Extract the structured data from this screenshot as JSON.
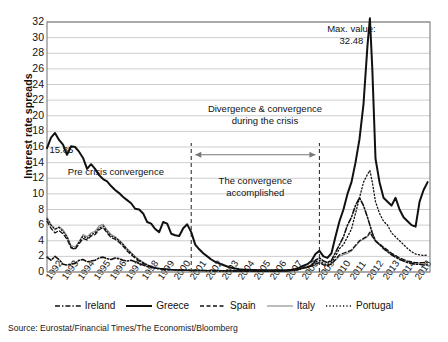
{
  "axis": {
    "ylabel": "Interest rate spreads",
    "yticks": [
      0,
      2,
      4,
      6,
      8,
      10,
      12,
      14,
      16,
      18,
      20,
      22,
      24,
      26,
      28,
      30,
      32
    ],
    "ylim": [
      0,
      32
    ],
    "xticks": [
      "1992",
      "1993",
      "1994",
      "1995",
      "1996",
      "1997",
      "1998",
      "1999",
      "2000",
      "2001",
      "2002",
      "2003",
      "2004",
      "2005",
      "2006",
      "2007",
      "2008",
      "2009",
      "2010",
      "2011",
      "2012",
      "2013",
      "2014",
      "2015"
    ],
    "xlim": [
      1992,
      2015
    ]
  },
  "annotations": {
    "start_value": "15.85",
    "max_value": "Max. value:\n32.48",
    "pre_crisis": "Pre crisis convergence",
    "divergence": "Divergence & convergence\nduring the crisis",
    "convergence": "The convergence\naccomplished"
  },
  "legend": [
    {
      "label": "Ireland",
      "style": "dash-dot",
      "color": "#111111",
      "width": 1.6
    },
    {
      "label": "Greece",
      "style": "solid",
      "color": "#111111",
      "width": 2.0
    },
    {
      "label": "Spain",
      "style": "dashed",
      "color": "#111111",
      "width": 1.3
    },
    {
      "label": "Italy",
      "style": "solid",
      "color": "#8f8f8f",
      "width": 1.2
    },
    {
      "label": "Portugal",
      "style": "dotted",
      "color": "#111111",
      "width": 1.3
    }
  ],
  "source": "Source: Eurostat/Financial Times/The Economist/Bloomberg",
  "colors": {
    "plot_border": "#6f6f6f",
    "gridline": "#b8b8b8",
    "marker_line": "#333333",
    "arrow": "#777777",
    "background": "#ffffff"
  },
  "chart_data": {
    "type": "line",
    "title": "",
    "xlabel": "",
    "ylabel": "Interest rate spreads",
    "xlim": [
      1992,
      2015.9
    ],
    "ylim": [
      0,
      32
    ],
    "grid": true,
    "legend_position": "bottom",
    "x": [
      1992.0,
      1992.25,
      1992.5,
      1992.75,
      1993.0,
      1993.25,
      1993.5,
      1993.75,
      1994.0,
      1994.25,
      1994.5,
      1994.75,
      1995.0,
      1995.25,
      1995.5,
      1995.75,
      1996.0,
      1996.25,
      1996.5,
      1996.75,
      1997.0,
      1997.25,
      1997.5,
      1997.75,
      1998.0,
      1998.25,
      1998.5,
      1998.75,
      1999.0,
      1999.25,
      1999.5,
      1999.75,
      2000.0,
      2000.25,
      2000.5,
      2000.75,
      2001.0,
      2001.25,
      2001.5,
      2001.75,
      2002.0,
      2002.25,
      2002.5,
      2002.75,
      2003.0,
      2003.25,
      2003.5,
      2003.75,
      2004.0,
      2004.25,
      2004.5,
      2004.75,
      2005.0,
      2005.25,
      2005.5,
      2005.75,
      2006.0,
      2006.25,
      2006.5,
      2006.75,
      2007.0,
      2007.25,
      2007.5,
      2007.75,
      2008.0,
      2008.25,
      2008.5,
      2008.75,
      2009.0,
      2009.25,
      2009.5,
      2009.75,
      2010.0,
      2010.25,
      2010.5,
      2010.75,
      2011.0,
      2011.25,
      2011.5,
      2011.75,
      2012.0,
      2012.15,
      2012.3,
      2012.5,
      2012.75,
      2013.0,
      2013.25,
      2013.5,
      2013.75,
      2014.0,
      2014.25,
      2014.5,
      2014.75,
      2015.0,
      2015.25,
      2015.5,
      2015.75
    ],
    "series": [
      {
        "name": "Greece",
        "style": "solid",
        "color": "#111111",
        "values": [
          15.85,
          17.2,
          17.8,
          16.9,
          16.3,
          15.0,
          16.1,
          16.0,
          15.4,
          14.6,
          13.2,
          13.8,
          13.2,
          12.4,
          11.9,
          11.6,
          11.0,
          10.5,
          10.1,
          9.6,
          9.2,
          8.8,
          8.1,
          8.0,
          7.5,
          6.4,
          6.2,
          5.5,
          5.1,
          6.4,
          6.2,
          4.9,
          4.7,
          4.6,
          5.6,
          6.1,
          5.1,
          3.5,
          2.9,
          2.4,
          2.0,
          1.6,
          1.3,
          1.1,
          0.9,
          0.7,
          0.55,
          0.45,
          0.35,
          0.3,
          0.28,
          0.26,
          0.25,
          0.24,
          0.24,
          0.23,
          0.22,
          0.22,
          0.22,
          0.23,
          0.25,
          0.28,
          0.4,
          0.55,
          0.8,
          1.0,
          1.4,
          2.3,
          2.7,
          2.0,
          1.8,
          2.4,
          4.5,
          6.5,
          8.0,
          10.0,
          11.5,
          14.0,
          17.0,
          21.5,
          29.0,
          32.48,
          26.0,
          14.5,
          11.5,
          9.5,
          9.0,
          8.5,
          9.5,
          8.0,
          7.0,
          6.5,
          6.0,
          5.8,
          9.0,
          10.5,
          11.5
        ]
      },
      {
        "name": "Portugal",
        "style": "dotted",
        "color": "#111111",
        "values": [
          6.8,
          6.0,
          5.5,
          5.7,
          5.2,
          4.5,
          3.2,
          3.0,
          3.8,
          4.6,
          4.3,
          4.8,
          5.0,
          5.6,
          5.9,
          5.2,
          4.6,
          4.4,
          4.0,
          3.5,
          2.9,
          2.4,
          1.9,
          1.5,
          1.2,
          0.9,
          0.7,
          0.55,
          0.45,
          0.4,
          0.35,
          0.3,
          0.28,
          0.26,
          0.25,
          0.24,
          0.22,
          0.2,
          0.2,
          0.2,
          0.18,
          0.18,
          0.17,
          0.17,
          0.16,
          0.16,
          0.15,
          0.15,
          0.14,
          0.14,
          0.14,
          0.14,
          0.13,
          0.13,
          0.13,
          0.13,
          0.13,
          0.13,
          0.14,
          0.15,
          0.17,
          0.2,
          0.28,
          0.4,
          0.6,
          0.7,
          0.9,
          1.3,
          1.5,
          1.1,
          0.9,
          1.2,
          2.0,
          3.0,
          3.5,
          4.5,
          5.5,
          7.5,
          9.5,
          11.5,
          12.5,
          13.0,
          11.5,
          9.0,
          7.5,
          6.5,
          6.0,
          5.0,
          4.5,
          4.0,
          3.5,
          3.0,
          2.6,
          2.3,
          2.2,
          2.1,
          2.2
        ]
      },
      {
        "name": "Ireland",
        "style": "dash-dot",
        "color": "#111111",
        "values": [
          1.9,
          1.5,
          2.0,
          1.6,
          1.0,
          0.9,
          1.0,
          1.1,
          1.5,
          1.6,
          1.3,
          1.4,
          1.5,
          1.8,
          1.9,
          1.7,
          1.6,
          1.8,
          1.7,
          1.5,
          1.4,
          1.5,
          1.3,
          1.1,
          0.9,
          0.7,
          0.6,
          0.5,
          0.4,
          0.35,
          0.3,
          0.28,
          0.25,
          0.24,
          0.23,
          0.22,
          0.2,
          0.2,
          0.19,
          0.19,
          0.18,
          0.18,
          0.17,
          0.17,
          0.16,
          0.16,
          0.15,
          0.15,
          0.14,
          0.14,
          0.14,
          0.13,
          0.13,
          0.13,
          0.12,
          0.12,
          0.12,
          0.12,
          0.13,
          0.14,
          0.16,
          0.19,
          0.26,
          0.35,
          0.5,
          0.6,
          0.8,
          1.5,
          1.8,
          1.4,
          1.2,
          1.5,
          2.5,
          3.5,
          4.5,
          6.0,
          7.0,
          8.5,
          9.5,
          8.5,
          7.0,
          6.0,
          5.0,
          4.0,
          3.5,
          3.0,
          2.6,
          2.2,
          1.9,
          1.6,
          1.4,
          1.2,
          1.1,
          1.0,
          1.0,
          0.9,
          0.9
        ]
      },
      {
        "name": "Spain",
        "style": "dashed",
        "color": "#111111",
        "values": [
          6.5,
          5.6,
          5.0,
          5.3,
          4.9,
          4.2,
          3.1,
          2.9,
          3.6,
          4.3,
          4.1,
          4.6,
          4.8,
          5.4,
          5.7,
          5.0,
          4.4,
          4.2,
          3.8,
          3.3,
          2.7,
          2.2,
          1.8,
          1.4,
          1.1,
          0.85,
          0.65,
          0.5,
          0.42,
          0.38,
          0.33,
          0.28,
          0.26,
          0.24,
          0.23,
          0.22,
          0.2,
          0.19,
          0.19,
          0.18,
          0.17,
          0.17,
          0.16,
          0.16,
          0.15,
          0.15,
          0.14,
          0.14,
          0.13,
          0.13,
          0.13,
          0.13,
          0.12,
          0.12,
          0.12,
          0.12,
          0.12,
          0.12,
          0.13,
          0.14,
          0.16,
          0.18,
          0.25,
          0.35,
          0.5,
          0.6,
          0.75,
          1.0,
          1.2,
          0.9,
          0.8,
          1.0,
          1.6,
          2.2,
          2.4,
          2.6,
          2.8,
          3.4,
          4.0,
          4.3,
          4.6,
          5.1,
          4.6,
          4.0,
          3.6,
          3.2,
          2.8,
          2.4,
          2.1,
          1.8,
          1.6,
          1.4,
          1.3,
          1.2,
          1.2,
          1.2,
          1.3
        ]
      },
      {
        "name": "Italy",
        "style": "solid",
        "color": "#8f8f8f",
        "values": [
          7.0,
          6.1,
          5.4,
          5.8,
          5.4,
          4.6,
          3.4,
          3.2,
          3.9,
          4.8,
          4.5,
          5.0,
          5.2,
          5.9,
          6.1,
          5.4,
          4.8,
          4.5,
          4.1,
          3.6,
          3.0,
          2.5,
          2.0,
          1.6,
          1.25,
          0.95,
          0.72,
          0.58,
          0.48,
          0.42,
          0.36,
          0.31,
          0.29,
          0.27,
          0.26,
          0.25,
          0.23,
          0.21,
          0.21,
          0.2,
          0.19,
          0.19,
          0.18,
          0.18,
          0.17,
          0.17,
          0.16,
          0.16,
          0.15,
          0.15,
          0.15,
          0.14,
          0.14,
          0.14,
          0.13,
          0.13,
          0.13,
          0.13,
          0.14,
          0.15,
          0.17,
          0.2,
          0.27,
          0.37,
          0.52,
          0.62,
          0.78,
          1.05,
          1.25,
          0.95,
          0.85,
          1.05,
          1.5,
          2.0,
          2.2,
          2.4,
          2.7,
          3.3,
          3.9,
          4.2,
          4.5,
          5.0,
          4.5,
          3.9,
          3.5,
          3.1,
          2.7,
          2.35,
          2.05,
          1.75,
          1.55,
          1.35,
          1.25,
          1.15,
          1.15,
          1.15,
          1.25
        ]
      }
    ]
  }
}
